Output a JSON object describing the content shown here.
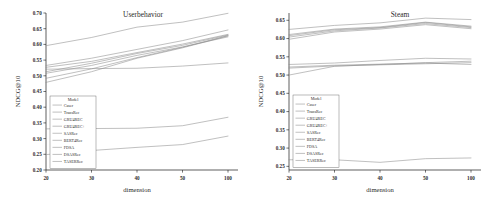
{
  "figure": {
    "background": "#ffffff"
  },
  "chart_data": [
    {
      "type": "line",
      "title": "Userbehavior",
      "xlabel": "dimension",
      "ylabel": "NDCG@10",
      "x": [
        20,
        30,
        40,
        50,
        100
      ],
      "xticklabels": [
        "20",
        "30",
        "40",
        "50",
        "100"
      ],
      "ylim": [
        0.2,
        0.7
      ],
      "yticks": [
        0.2,
        0.25,
        0.3,
        0.35,
        0.4,
        0.45,
        0.5,
        0.55,
        0.6,
        0.65,
        0.7
      ],
      "yticklabels": [
        "0.20",
        "0.25",
        "0.30",
        "0.35",
        "0.40",
        "0.45",
        "0.50",
        "0.55",
        "0.60",
        "0.65",
        "0.70"
      ],
      "grid": false,
      "legend_position": "lower-left",
      "legend_title": "Model",
      "series": [
        {
          "name": "Caser",
          "color": "#8c8c8c",
          "values": [
            0.479,
            0.513,
            0.556,
            0.589,
            0.627
          ]
        },
        {
          "name": "TransRec",
          "color": "#8c8c8c",
          "values": [
            0.492,
            0.522,
            0.558,
            0.591,
            0.628
          ]
        },
        {
          "name": "GRU4REC",
          "color": "#8c8c8c",
          "values": [
            0.508,
            0.533,
            0.565,
            0.592,
            0.624
          ]
        },
        {
          "name": "GRU4REC+",
          "color": "#8c8c8c",
          "values": [
            0.513,
            0.54,
            0.571,
            0.597,
            0.63
          ]
        },
        {
          "name": "SASRec",
          "color": "#8c8c8c",
          "values": [
            0.527,
            0.546,
            0.574,
            0.601,
            0.632
          ]
        },
        {
          "name": "BERT4Rec",
          "color": "#8c8c8c",
          "values": [
            0.533,
            0.556,
            0.584,
            0.612,
            0.646
          ]
        },
        {
          "name": "FDSA",
          "color": "#8c8c8c",
          "values": [
            0.596,
            0.622,
            0.655,
            0.671,
            0.699
          ]
        },
        {
          "name": "DSASRec",
          "color": "#8c8c8c",
          "values": [
            0.521,
            0.523,
            0.524,
            0.531,
            0.541
          ]
        },
        {
          "name": "TASERRec",
          "color": "#8c8c8c",
          "values": [
            0.331,
            0.332,
            0.333,
            0.341,
            0.368
          ]
        },
        {
          "name": "TASERRec-low",
          "color": "#8c8c8c",
          "values": [
            0.249,
            0.262,
            0.272,
            0.281,
            0.308
          ]
        }
      ]
    },
    {
      "type": "line",
      "title": "Steam",
      "xlabel": "dimension",
      "ylabel": "NDCG@10",
      "x": [
        20,
        30,
        40,
        50,
        100
      ],
      "xticklabels": [
        "20",
        "30",
        "40",
        "50",
        "100"
      ],
      "ylim": [
        0.24,
        0.67
      ],
      "yticks": [
        0.25,
        0.3,
        0.35,
        0.4,
        0.45,
        0.5,
        0.55,
        0.6,
        0.65
      ],
      "yticklabels": [
        "0.25",
        "0.30",
        "0.35",
        "0.40",
        "0.45",
        "0.50",
        "0.55",
        "0.60",
        "0.65"
      ],
      "grid": false,
      "legend_position": "lower-left",
      "legend_title": "Model",
      "series": [
        {
          "name": "Caser",
          "color": "#8c8c8c",
          "values": [
            0.598,
            0.618,
            0.626,
            0.638,
            0.627
          ]
        },
        {
          "name": "TransRec",
          "color": "#8c8c8c",
          "values": [
            0.604,
            0.621,
            0.629,
            0.641,
            0.63
          ]
        },
        {
          "name": "GRU4REC",
          "color": "#8c8c8c",
          "values": [
            0.608,
            0.624,
            0.63,
            0.644,
            0.632
          ]
        },
        {
          "name": "GRU4REC+",
          "color": "#8c8c8c",
          "values": [
            0.611,
            0.626,
            0.632,
            0.645,
            0.634
          ]
        },
        {
          "name": "SASRec",
          "color": "#8c8c8c",
          "values": [
            0.625,
            0.636,
            0.643,
            0.656,
            0.652
          ]
        },
        {
          "name": "BERT4Rec",
          "color": "#8c8c8c",
          "values": [
            0.5,
            0.524,
            0.529,
            0.534,
            0.538
          ]
        },
        {
          "name": "FDSA",
          "color": "#8c8c8c",
          "values": [
            0.519,
            0.525,
            0.528,
            0.531,
            0.534
          ]
        },
        {
          "name": "DSASRec",
          "color": "#8c8c8c",
          "values": [
            0.522,
            0.527,
            0.53,
            0.533,
            0.529
          ]
        },
        {
          "name": "TASERRec",
          "color": "#8c8c8c",
          "values": [
            0.529,
            0.533,
            0.54,
            0.546,
            0.544
          ]
        },
        {
          "name": "TASERRec-low",
          "color": "#8c8c8c",
          "values": [
            0.268,
            0.268,
            0.261,
            0.271,
            0.273
          ]
        }
      ]
    }
  ],
  "legend_entries": [
    "Caser",
    "TransRec",
    "GRU4REC",
    "GRU4REC+",
    "SASRec",
    "BERT4Rec",
    "FDSA",
    "DSASRec",
    "TASERRec"
  ]
}
